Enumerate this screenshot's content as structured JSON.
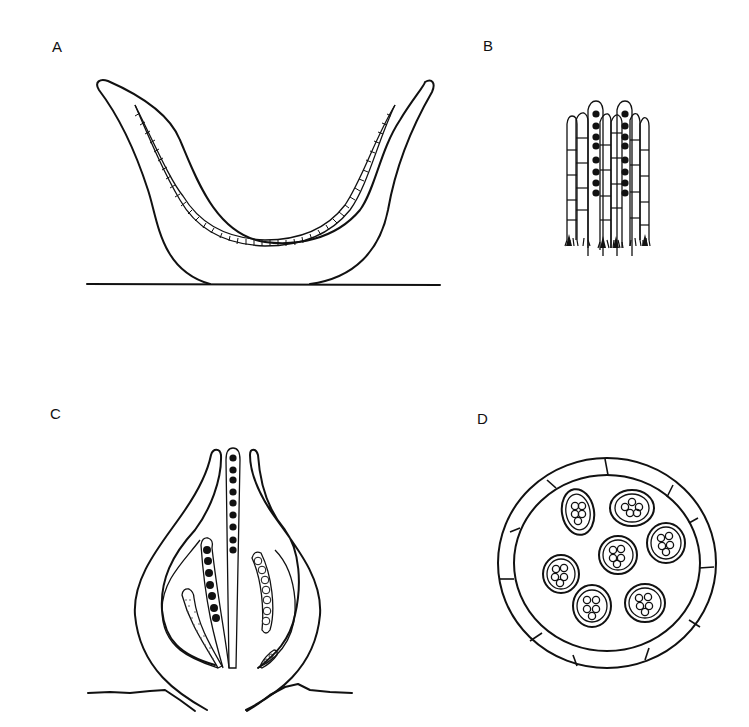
{
  "figure": {
    "panels": [
      {
        "id": "A",
        "label": "A",
        "subject": "cup-shaped ascocarp (apothecium) on substrate, with hymenium layer lining the cup"
      },
      {
        "id": "B",
        "label": "B",
        "subject": "hymenium detail: two asci with dark ascospores among septate paraphyses"
      },
      {
        "id": "C",
        "label": "C",
        "subject": "flask-shaped ascocarp (perithecium) in section with asci at various stages"
      },
      {
        "id": "D",
        "label": "D",
        "subject": "closed ascocarp (cleistothecium) in section with scattered asci containing ascospores"
      }
    ]
  },
  "colors": {
    "ink": "#111111",
    "background": "#ffffff"
  }
}
